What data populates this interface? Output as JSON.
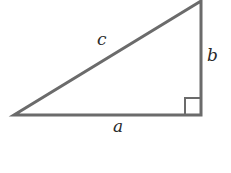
{
  "diagram": {
    "type": "right-triangle",
    "stroke_color": "#6b6b6b",
    "labels": {
      "hypotenuse": "c",
      "vertical_leg": "b",
      "horizontal_leg": "a"
    }
  }
}
